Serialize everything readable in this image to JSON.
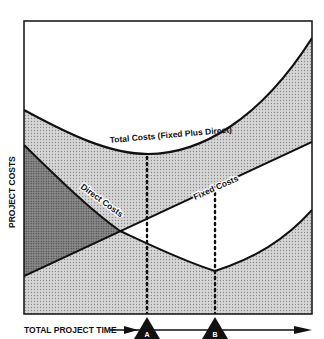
{
  "diagram": {
    "type": "cost-time tradeoff curve",
    "y_axis_label": "PROJECT COSTS",
    "x_axis_label": "TOTAL PROJECT TIME",
    "curves": {
      "total": "Total Costs (Fixed Plus Direct)",
      "direct": "Direct Costs",
      "fixed": "Fixed Costs"
    },
    "markers": [
      {
        "label": "A",
        "meaning": "minimum total cost point"
      },
      {
        "label": "B",
        "meaning": "minimum direct cost point"
      }
    ],
    "colors": {
      "line": "#111111",
      "shade_light": "#c9c9c9",
      "shade_dark": "#7a7a7a",
      "background": "#ffffff"
    }
  }
}
